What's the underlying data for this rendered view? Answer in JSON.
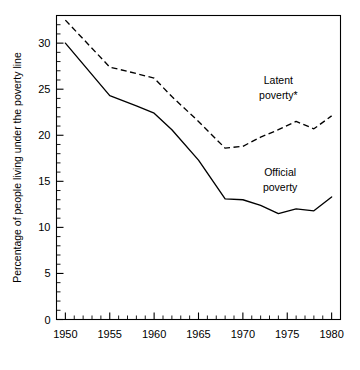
{
  "chart_data": {
    "type": "line",
    "title": "",
    "xlabel": "",
    "ylabel": "Percentage of people living under the poverty line",
    "xlim": [
      1949,
      1981
    ],
    "ylim": [
      0,
      33
    ],
    "grid": false,
    "legend_position": "inline-annotations",
    "x_major_ticks": [
      1950,
      1955,
      1960,
      1965,
      1970,
      1975,
      1980
    ],
    "x_tick_labels": [
      "1950",
      "1955",
      "1960",
      "1965",
      "1970",
      "1975",
      "1980"
    ],
    "x_minor_tick_step": 1,
    "y_major_ticks": [
      0,
      5,
      10,
      15,
      20,
      25,
      30
    ],
    "y_tick_labels": [
      "0",
      "5",
      "10",
      "15",
      "20",
      "25",
      "30"
    ],
    "y_minor_tick_step": 1,
    "x": [
      1950,
      1955,
      1958,
      1960,
      1962,
      1965,
      1968,
      1970,
      1972,
      1974,
      1976,
      1978,
      1980
    ],
    "series": [
      {
        "name": "Latent poverty*",
        "style": "dashed",
        "label_line1": "Latent",
        "label_line2": "poverty*",
        "values": [
          32.5,
          27.4,
          26.7,
          26.2,
          24.2,
          21.5,
          18.6,
          18.8,
          19.8,
          20.6,
          21.5,
          20.7,
          22.1
        ]
      },
      {
        "name": "Official poverty",
        "style": "solid",
        "label_line1": "Official",
        "label_line2": "poverty",
        "values": [
          30.0,
          24.3,
          23.2,
          22.4,
          20.6,
          17.3,
          13.1,
          13.0,
          12.4,
          11.5,
          12.0,
          11.8,
          13.3
        ]
      }
    ],
    "annotations": [
      {
        "text": "Latent",
        "x": 1974.0,
        "y": 25.6
      },
      {
        "text": "poverty*",
        "x": 1974.0,
        "y": 23.9
      },
      {
        "text": "Official",
        "x": 1974.2,
        "y": 15.6
      },
      {
        "text": "poverty",
        "x": 1974.2,
        "y": 13.9
      }
    ]
  }
}
